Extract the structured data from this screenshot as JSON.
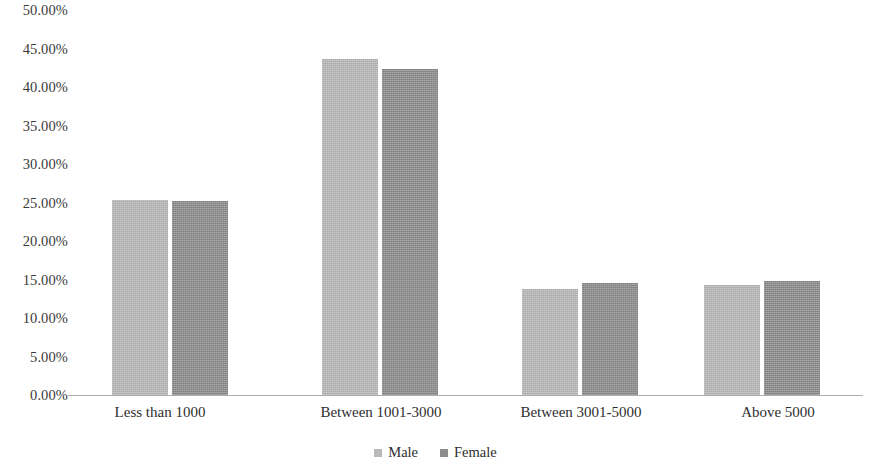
{
  "chart_data": {
    "type": "bar",
    "title": "",
    "subtitle": "",
    "xlabel": "",
    "ylabel": "",
    "grid": false,
    "legend_position": "bottom-center",
    "categories": [
      "Less than 1000",
      "Between 1001-3000",
      "Between 3001-5000",
      "Above 5000"
    ],
    "series": [
      {
        "name": "Male",
        "color": "#b9b9b9",
        "values": [
          25.3,
          43.7,
          13.8,
          14.3
        ]
      },
      {
        "name": "Female",
        "color": "#8c8c8c",
        "values": [
          25.2,
          42.3,
          14.6,
          14.8
        ]
      }
    ],
    "ylim": [
      0,
      50
    ],
    "ytick_values": [
      0,
      5,
      10,
      15,
      20,
      25,
      30,
      35,
      40,
      45,
      50
    ],
    "ytick_labels": [
      "0.00%",
      "5.00%",
      "10.00%",
      "15.00%",
      "20.00%",
      "25.00%",
      "30.00%",
      "35.00%",
      "40.00%",
      "45.00%",
      "50.00%"
    ]
  },
  "legend": {
    "entries": [
      {
        "label": "Male",
        "color": "#b9b9b9"
      },
      {
        "label": "Female",
        "color": "#8c8c8c"
      }
    ]
  },
  "axis": {
    "line_color": "#b0aca6"
  }
}
